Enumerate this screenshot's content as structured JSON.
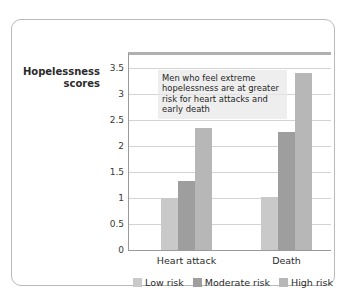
{
  "chart_data": {
    "type": "bar",
    "title": "",
    "subtitle": "",
    "xlabel": "",
    "ylabel": "Hopelessness scores",
    "categories": [
      "Heart attack",
      "Death"
    ],
    "series": [
      {
        "name": "Low risk",
        "values": [
          1.0,
          1.02
        ],
        "color": "#c9c9c9"
      },
      {
        "name": "Moderate risk",
        "values": [
          1.33,
          2.27
        ],
        "color": "#9e9e9e"
      },
      {
        "name": "High risk",
        "values": [
          2.35,
          3.4
        ],
        "color": "#b7b7b7"
      }
    ],
    "ylim": [
      0,
      3.75
    ],
    "yticks": [
      "0",
      "0.5",
      "1",
      "1.5",
      "2",
      "2.5",
      "3",
      "3.5"
    ],
    "ytick_values": [
      0,
      0.5,
      1,
      1.5,
      2,
      2.5,
      3,
      3.5
    ],
    "grid": true,
    "legend_position": "bottom",
    "annotations": [
      {
        "text": "Men who feel extreme hopelessness are at greater risk for heart attacks and early death",
        "background": "#e8e8e8"
      }
    ]
  },
  "axis": {
    "y_title_line1": "Hopelessness",
    "y_title_line2": "scores"
  },
  "frame": {
    "border_color": "#b9b9b9"
  }
}
